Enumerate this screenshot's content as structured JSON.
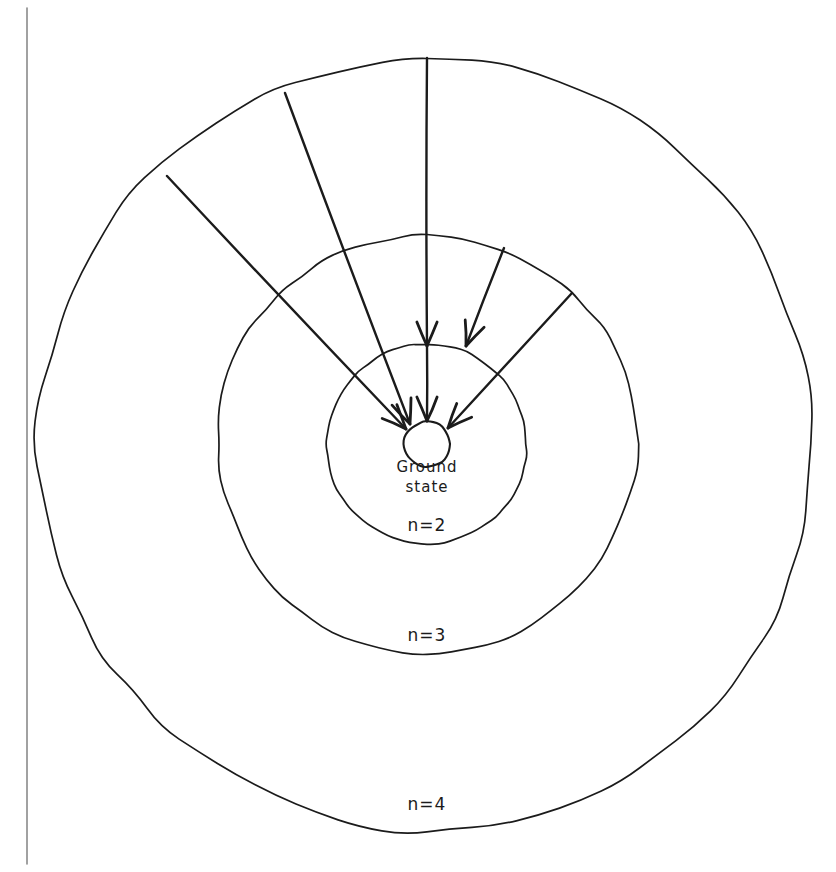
{
  "figure": {
    "kind": "hand-drawn-diagram",
    "background_color": "#ffffff",
    "ink_color": "#1b1b1b",
    "margin_rule_color": "#8a8a8a",
    "canvas": {
      "width": 836,
      "height": 872
    }
  },
  "margin_rule": {
    "name": "page-margin-line",
    "x": 27,
    "y_top": 8,
    "y_bottom": 864
  },
  "center": {
    "x": 427,
    "y": 444
  },
  "shells": [
    {
      "id": "ground",
      "label": "Ground\nstate",
      "label_line_1": "Ground",
      "label_line_2": "state",
      "radius": 23,
      "label_x": 427,
      "label_y_1": 472,
      "label_y_2": 492,
      "label_size": 15
    },
    {
      "id": "n2",
      "label": "n=2",
      "radius": 100,
      "label_x": 427,
      "label_y": 531,
      "label_size": 17
    },
    {
      "id": "n3",
      "label": "n=3",
      "radius": 210,
      "label_x": 427,
      "label_y": 641,
      "label_size": 17
    },
    {
      "id": "n4",
      "label": "n=4",
      "radius": 388,
      "label_x": 427,
      "label_y": 810,
      "label_size": 17
    }
  ],
  "transitions": [
    {
      "id": "t1",
      "from_shell": "n4",
      "to_shell": "n2",
      "from_x": 427,
      "from_y": 58,
      "to_x": 427,
      "to_y": 346,
      "head": "single"
    },
    {
      "id": "t2",
      "from_shell": "n4",
      "to_shell": "ground",
      "from_x": 285,
      "from_y": 93,
      "to_x": 410,
      "to_y": 424,
      "head": "single"
    },
    {
      "id": "t3",
      "from_shell": "n4",
      "to_shell": "ground",
      "from_x": 167,
      "from_y": 176,
      "to_x": 406,
      "to_y": 429,
      "head": "single"
    },
    {
      "id": "t4",
      "from_shell": "n3",
      "to_shell": "n2",
      "from_x": 504,
      "from_y": 248,
      "to_x": 466,
      "to_y": 346,
      "head": "single"
    },
    {
      "id": "t5",
      "from_shell": "n3",
      "to_shell": "ground",
      "from_x": 572,
      "from_y": 293,
      "to_x": 448,
      "to_y": 428,
      "head": "single"
    },
    {
      "id": "t6",
      "from_shell": "n2",
      "to_shell": "ground",
      "from_x": 427,
      "from_y": 346,
      "to_x": 427,
      "to_y": 421,
      "head": "single"
    }
  ],
  "counts": {
    "shells_total": 4,
    "arrows_total": 6,
    "arrows_into_ground_state": 4,
    "arrows_into_n2": 2
  }
}
